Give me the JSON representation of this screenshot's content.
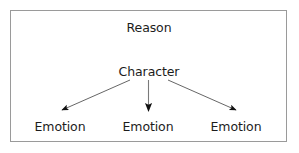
{
  "figure": {
    "kind": "hierarchy-diagram",
    "background_color": "#ffffff",
    "border_color": "#9a9a9a",
    "text_color": "#1c1c1c",
    "arrow_color": "#4d4d4d",
    "arrowhead_color": "#111111"
  },
  "nodes": {
    "top": {
      "label": "Reason"
    },
    "middle": {
      "label": "Character"
    },
    "bottom": [
      {
        "label": "Emotion"
      },
      {
        "label": "Emotion"
      },
      {
        "label": "Emotion"
      }
    ]
  },
  "arrows": [
    {
      "name": "character-to-emotion-left",
      "from": "Character",
      "to": "Emotion"
    },
    {
      "name": "character-to-emotion-center",
      "from": "Character",
      "to": "Emotion"
    },
    {
      "name": "character-to-emotion-right",
      "from": "Character",
      "to": "Emotion"
    }
  ]
}
